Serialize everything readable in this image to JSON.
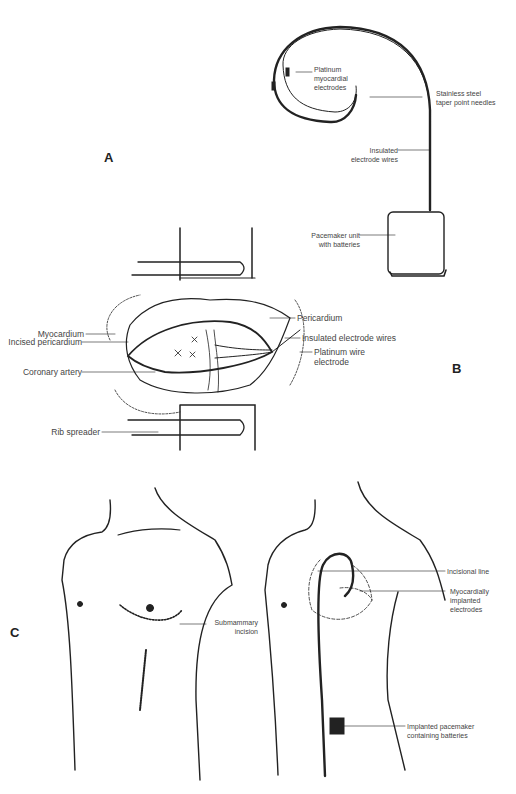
{
  "panels": {
    "a": {
      "letter": "A"
    },
    "b": {
      "letter": "B"
    },
    "c": {
      "letter": "C"
    }
  },
  "labels": {
    "platinum_myocardial_electrodes": "Platinum\nmyocardial\nelectrodes",
    "stainless_steel_needles": "Stainless steel\ntaper point needles",
    "insulated_electrode_wires_a": "Insulated\nelectrode  wires",
    "pacemaker_unit": "Pacemaker unit\nwith batteries",
    "myocardium": "Myocardium",
    "incised_pericardium": "Incised pericardium",
    "coronary_artery": "Coronary artery",
    "rib_spreader": "Rib spreader",
    "pericardium": "Pericardium",
    "insulated_electrode_wires_b": "Insulated electrode wires",
    "platinum_wire_electrode": "Platinum wire\nelectrode",
    "submammary_incision": "Submammary\nincision",
    "incisional_line": "Incisional line",
    "myocardially_implanted_electrodes": "Myocardially\nimplanted\nelectrodes",
    "implanted_pacemaker": "Implanted pacemaker\ncontaining batteries"
  },
  "colors": {
    "ink": "#222222",
    "label": "#444444",
    "background": "#ffffff"
  }
}
